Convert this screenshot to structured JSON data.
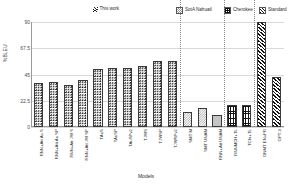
{
  "legend": {
    "this_work": {
      "label": "This work",
      "marker": "hatch-marker"
    },
    "items": [
      {
        "label": "SotA Nahuatl",
        "swatch": "checker-swatch"
      },
      {
        "label": "Cherokee",
        "swatch": "grid-swatch"
      },
      {
        "label": "Standard",
        "swatch": "diagonal-swatch"
      }
    ]
  },
  "chart_data": {
    "type": "bar",
    "title": "",
    "xlabel": "Models",
    "ylabel": "%BLEU",
    "ylim": [
      0,
      90
    ],
    "yticks": [
      "0",
      "22.5",
      "45",
      "67.5",
      "90"
    ],
    "grid": true,
    "legend_position": "top",
    "categories": [
      "RNN+Att Au S",
      "RNN+Att Au SP",
      "RNN+Att JW S",
      "RNN+Att JW SP",
      "TAuS",
      "TAuSP",
      "TAuSPv2",
      "TJWS",
      "TJWSP",
      "TJWSPv2",
      "SMT M",
      "SMT UNAM",
      "RNN+Att UNAM",
      "RNNMCH+TL",
      "TChr+TL",
      "GNMT EN+FR",
      "GPT-3"
    ],
    "values": [
      38,
      39,
      36,
      40,
      50,
      51,
      51,
      52,
      57,
      57,
      13,
      16,
      10,
      19,
      19,
      90,
      43
    ],
    "groups": [
      {
        "name": "This work",
        "pattern": "circles",
        "indices": [
          0,
          1,
          2,
          3,
          4,
          5,
          6,
          7,
          8,
          9
        ]
      },
      {
        "name": "SotA Nahuatl",
        "pattern": "checker",
        "indices": [
          10,
          11,
          12
        ]
      },
      {
        "name": "Cherokee",
        "pattern": "grid",
        "indices": [
          13,
          14
        ]
      },
      {
        "name": "Standard",
        "pattern": "diagonal",
        "indices": [
          15,
          16
        ]
      }
    ],
    "series": [
      {
        "name": "%BLEU",
        "values": [
          38,
          39,
          36,
          40,
          50,
          51,
          51,
          52,
          57,
          57,
          13,
          16,
          10,
          19,
          19,
          90,
          43
        ]
      }
    ]
  }
}
